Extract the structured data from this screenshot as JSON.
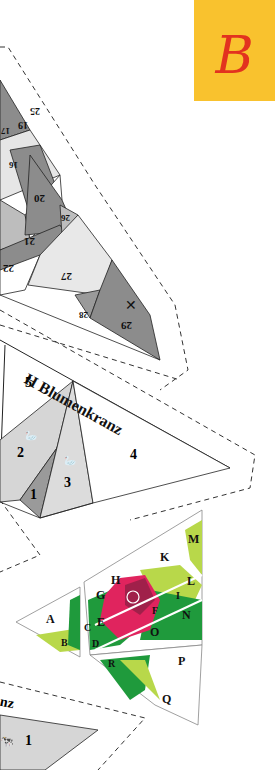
{
  "section_badge": {
    "letter": "B",
    "background": "#f9c22e",
    "color": "#e2321f"
  },
  "pattern_top": {
    "description": "Swirl paper-piecing template (partial, rotated)",
    "segment_numbers": [
      "25",
      "19",
      "17",
      "16",
      "20",
      "21",
      "22",
      "26",
      "27",
      "28",
      "29"
    ]
  },
  "pattern_h": {
    "title": "H Blumenkranz",
    "segments": [
      "1",
      "2",
      "3",
      "4",
      "5"
    ]
  },
  "rose_block": {
    "labels": [
      "A",
      "B",
      "C",
      "D",
      "E",
      "F",
      "G",
      "H",
      "I",
      "K",
      "L",
      "M",
      "N",
      "O",
      "P",
      "Q",
      "R"
    ],
    "colors": {
      "rose": "#e0245e",
      "rose_dark": "#a0204a",
      "leaf_dark": "#1f9a3c",
      "leaf_light": "#b8d84a"
    }
  },
  "pattern_bottom": {
    "title_fragment": "nz",
    "segments": [
      "1"
    ]
  }
}
